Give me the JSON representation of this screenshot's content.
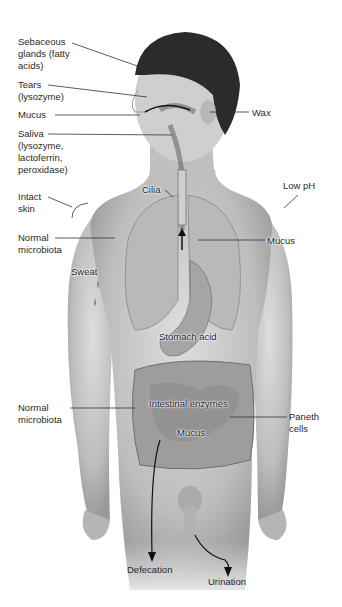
{
  "diagram": {
    "labels": {
      "sebaceous": "Sebaceous\nglands (fatty\nacids)",
      "tears": "Tears\n(lysozyme)",
      "mucus_nose": "Mucus",
      "saliva": "Saliva\n(lysozyme,\nlactoferrin,\nperoxidase)",
      "intact_skin": "Intact\nskin",
      "normal_microbiota_upper": "Normal\nmicrobiota",
      "sweat": "Sweat",
      "normal_microbiota_lower": "Normal\nmicrobiota",
      "wax": "Wax",
      "cilia": "Cilia",
      "low_ph": "Low pH",
      "mucus_lungs": "Mucus",
      "stomach_acid": "Stomach acid",
      "intestinal_enzymes": "Intestinal enzymes",
      "mucus_intestine": "Mucus",
      "paneth_cells": "Paneth\ncells",
      "defecation": "Defecation",
      "urination": "Urination"
    },
    "colors": {
      "skin": "#c9c9c9",
      "hair": "#2b2b2b",
      "organ": "#a9a9a9",
      "line": "#333333",
      "text": "#2a2a2a"
    }
  }
}
